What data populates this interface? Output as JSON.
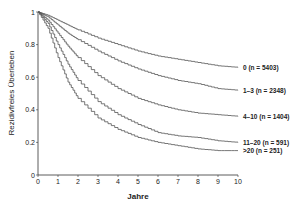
{
  "chart_data": {
    "type": "line",
    "title": "",
    "xlabel": "Jahre",
    "ylabel": "Rezidivfreies Überleben",
    "xlim": [
      0,
      10
    ],
    "ylim": [
      0,
      1
    ],
    "xticks": [
      "0",
      "1",
      "2",
      "3",
      "4",
      "5",
      "6",
      "7",
      "8",
      "9",
      "10"
    ],
    "yticks": [
      "0",
      "0.2",
      "0.4",
      "0.6",
      "0.8",
      "1"
    ],
    "grid": false,
    "legend_position": "right, inline labels at curve ends",
    "x": [
      0,
      0.5,
      1,
      1.5,
      2,
      3,
      4,
      5,
      6,
      7,
      8,
      9,
      10
    ],
    "series": [
      {
        "name": "0 (n = 5403)",
        "values": [
          1.0,
          0.98,
          0.95,
          0.92,
          0.89,
          0.84,
          0.8,
          0.76,
          0.73,
          0.71,
          0.69,
          0.67,
          0.66
        ]
      },
      {
        "name": "1–3 (n = 2348)",
        "values": [
          1.0,
          0.97,
          0.92,
          0.87,
          0.83,
          0.76,
          0.7,
          0.65,
          0.61,
          0.58,
          0.56,
          0.53,
          0.52
        ]
      },
      {
        "name": "4–10 (n = 1404)",
        "values": [
          1.0,
          0.95,
          0.87,
          0.79,
          0.72,
          0.61,
          0.53,
          0.47,
          0.43,
          0.4,
          0.38,
          0.37,
          0.36
        ]
      },
      {
        "name": "11–20 (n = 591)",
        "values": [
          1.0,
          0.93,
          0.8,
          0.68,
          0.58,
          0.45,
          0.37,
          0.31,
          0.26,
          0.24,
          0.23,
          0.21,
          0.2
        ]
      },
      {
        "name": ">20 (n = 251)",
        "values": [
          1.0,
          0.9,
          0.72,
          0.57,
          0.47,
          0.35,
          0.28,
          0.23,
          0.2,
          0.18,
          0.16,
          0.15,
          0.15
        ]
      }
    ]
  }
}
